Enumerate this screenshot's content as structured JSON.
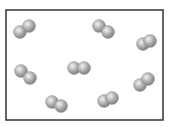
{
  "diagram": {
    "type": "particle-box",
    "box": {
      "x": 6,
      "y": 10,
      "width": 157,
      "height": 110,
      "stroke": "#333333"
    },
    "atom_radius": 6.5,
    "atom_color": "#9a9a9a",
    "molecules": [
      {
        "id": "m1",
        "atoms": [
          [
            20,
            32
          ],
          [
            29,
            26
          ]
        ]
      },
      {
        "id": "m2",
        "atoms": [
          [
            99,
            26
          ],
          [
            108,
            32
          ]
        ]
      },
      {
        "id": "m3",
        "atoms": [
          [
            143,
            44
          ],
          [
            150,
            41
          ]
        ]
      },
      {
        "id": "m4",
        "atoms": [
          [
            21,
            71
          ],
          [
            30,
            78
          ]
        ]
      },
      {
        "id": "m5",
        "atoms": [
          [
            74,
            68
          ],
          [
            84,
            68
          ]
        ]
      },
      {
        "id": "m6",
        "atoms": [
          [
            52,
            102
          ],
          [
            61,
            106
          ]
        ]
      },
      {
        "id": "m7",
        "atoms": [
          [
            104,
            101
          ],
          [
            112,
            98
          ]
        ]
      },
      {
        "id": "m8",
        "atoms": [
          [
            140,
            85
          ],
          [
            148,
            79
          ]
        ]
      }
    ],
    "molecule_count": 8
  }
}
